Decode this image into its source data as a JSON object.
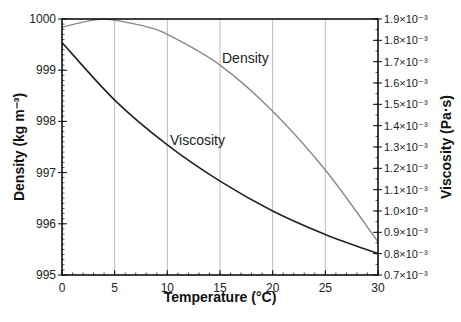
{
  "chart_data": {
    "type": "line",
    "title": "",
    "xlabel": "Temperature (°C)",
    "ylabel": "Density (kg m⁻³)",
    "ylabel_right": "Viscosity (Pa·s)",
    "xlim": [
      0,
      30
    ],
    "ylim": [
      995,
      1000
    ],
    "ylim_right": [
      0.0007,
      0.0019
    ],
    "x_ticks": [
      "0",
      "5",
      "10",
      "15",
      "20",
      "25",
      "30"
    ],
    "y_ticks": [
      "995",
      "996",
      "997",
      "998",
      "999",
      "1000"
    ],
    "y_ticks_right": [
      "0.7×10⁻³",
      "0.8×10⁻³",
      "0.9×10⁻³",
      "1.0×10⁻³",
      "1.1×10⁻³",
      "1.2×10⁻³",
      "1.3×10⁻³",
      "1.4×10⁻³",
      "1.5×10⁻³",
      "1.6×10⁻³",
      "1.7×10⁻³",
      "1.8×10⁻³",
      "1.9×10⁻³"
    ],
    "grid": "vertical lines at x ticks",
    "x": [
      0,
      5,
      10,
      15,
      20,
      25,
      30
    ],
    "series": [
      {
        "name": "Density",
        "axis": "left",
        "color": "#888888",
        "values": [
          999.84,
          999.97,
          999.7,
          999.1,
          998.2,
          997.05,
          995.65
        ]
      },
      {
        "name": "Viscosity",
        "axis": "right",
        "color": "#222222",
        "values": [
          0.00179,
          0.00152,
          0.00131,
          0.00114,
          0.001,
          0.00089,
          0.0008
        ]
      }
    ],
    "annotations": [
      {
        "text": "Density",
        "x": 16,
        "y_left": 998.9
      },
      {
        "text": "Viscosity",
        "x": 10.5,
        "y_left": 997.4
      }
    ]
  },
  "labels": {
    "xlabel": "Temperature (°C)",
    "ylabel": "Density (kg m⁻³)",
    "ylabel_right": "Viscosity (Pa·s)",
    "density_curve": "Density",
    "viscosity_curve": "Viscosity"
  }
}
